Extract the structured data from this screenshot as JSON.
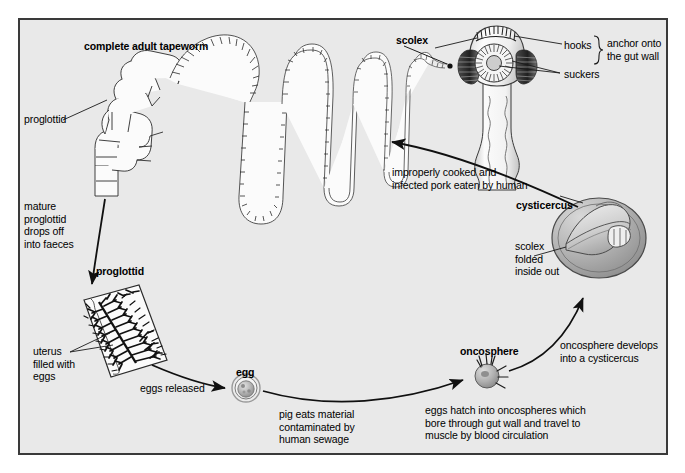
{
  "diagram": {
    "background_color": "#e9e9e9",
    "border_color": "#3a3a3a",
    "text_color": "#000000"
  },
  "labels": {
    "complete_adult_tapeworm": "complete adult tapeworm",
    "proglottid_top": "proglottid",
    "mature_proglottid_drops": "mature\nproglottid\ndrops off\ninto faeces",
    "proglottid_mid": "proglottid",
    "uterus_filled_with_eggs": "uterus\nfilled with\neggs",
    "eggs_released": "eggs released",
    "egg": "egg",
    "pig_eats_material": "pig eats material\ncontaminated by\nhuman sewage",
    "oncosphere": "oncosphere",
    "eggs_hatch": "eggs hatch into oncospheres which\nbore through gut wall and travel to\nmuscle by blood circulation",
    "oncosphere_develops": "oncosphere develops\ninto a cysticercus",
    "cysticercus": "cysticercus",
    "scolex_folded": "scolex\nfolded\ninside out",
    "improperly_cooked": "improperly cooked and\ninfected pork eaten by human",
    "scolex": "scolex",
    "hooks": "hooks",
    "suckers": "suckers",
    "anchor_onto_gut_wall": "anchor onto\nthe gut wall"
  },
  "structures": {
    "adult_tapeworm": "coiled segmented ribbon of proglottids",
    "scolex_head": "dome head with hooks, central sucker and two lateral suckers",
    "gravid_proglottid": "tilted rectangle with branching uterus filled with eggs",
    "egg_sphere": "small round shelled egg",
    "oncosphere_larva": "small sphere with six hooklets",
    "cysticercus_bladder": "grey fluid-filled bladder containing inverted scolex"
  }
}
